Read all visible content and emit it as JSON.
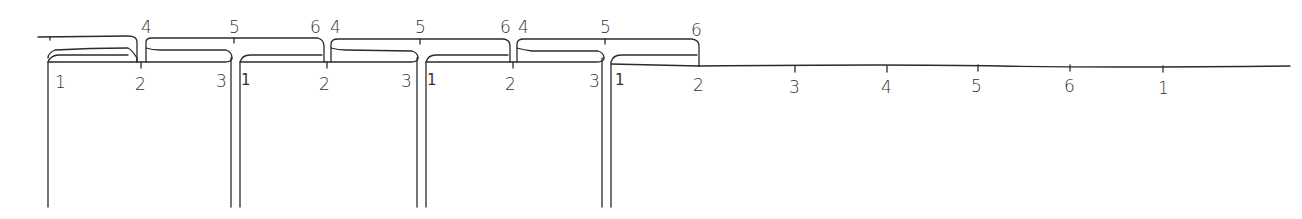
{
  "diagram": {
    "title": "",
    "style": "hand-drawn sketch",
    "stroke_color": "#2b2b2b",
    "background": "#ffffff",
    "upper_rail": {
      "tick_labels": [
        {
          "id": "u4a",
          "text": "4",
          "x": 146,
          "y": 33
        },
        {
          "id": "u5a",
          "text": "5",
          "x": 234,
          "y": 33
        },
        {
          "id": "u6a",
          "text": "6",
          "x": 316,
          "y": 33
        },
        {
          "id": "u4b",
          "text": "4",
          "x": 338,
          "y": 33
        },
        {
          "id": "u5b",
          "text": "5",
          "x": 420,
          "y": 33
        },
        {
          "id": "u6b",
          "text": "6",
          "x": 507,
          "y": 33
        },
        {
          "id": "u4c",
          "text": "4",
          "x": 525,
          "y": 33
        },
        {
          "id": "u5c",
          "text": "5",
          "x": 606,
          "y": 33
        },
        {
          "id": "u6c",
          "text": "6",
          "x": 697,
          "y": 36
        }
      ]
    },
    "lower_rail": {
      "tick_labels": [
        {
          "id": "l1a",
          "text": "1",
          "x": 60,
          "y": 86
        },
        {
          "id": "l2a",
          "text": "2",
          "x": 142,
          "y": 90
        },
        {
          "id": "l3a",
          "text": "3",
          "x": 222,
          "y": 86
        },
        {
          "id": "l1b",
          "text": "1",
          "x": 243,
          "y": 84
        },
        {
          "id": "l2b",
          "text": "2",
          "x": 326,
          "y": 90
        },
        {
          "id": "l3b",
          "text": "3",
          "x": 408,
          "y": 86
        },
        {
          "id": "l1c",
          "text": "1",
          "x": 429,
          "y": 84
        },
        {
          "id": "l2c",
          "text": "2",
          "x": 512,
          "y": 89
        },
        {
          "id": "l3c",
          "text": "3",
          "x": 596,
          "y": 86
        },
        {
          "id": "l1d",
          "text": "1",
          "x": 617,
          "y": 84
        },
        {
          "id": "l2d",
          "text": "2",
          "x": 700,
          "y": 90
        }
      ]
    },
    "axis": {
      "tick_labels": [
        {
          "id": "a3",
          "text": "3",
          "x": 795,
          "y": 93
        },
        {
          "id": "a4",
          "text": "4",
          "x": 888,
          "y": 93
        },
        {
          "id": "a5",
          "text": "5",
          "x": 977,
          "y": 93
        },
        {
          "id": "a6",
          "text": "6",
          "x": 1070,
          "y": 93
        },
        {
          "id": "a1",
          "text": "1",
          "x": 1162,
          "y": 93
        }
      ]
    },
    "panel_count": 4
  }
}
